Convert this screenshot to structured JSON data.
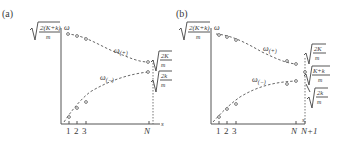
{
  "panels": [
    {
      "label": "(a)",
      "y_axis_label": "ω",
      "x_axis_label": "s",
      "top_value": {
        "num": "2(K+k)",
        "den": "m"
      },
      "upper_branch": {
        "name": "ω",
        "sub": "(+)"
      },
      "lower_branch": {
        "name": "ω",
        "sub": "(−)"
      },
      "upper_end_value": {
        "num": "2K",
        "den": "m"
      },
      "lower_end_value": {
        "num": "2k",
        "den": "m"
      },
      "x_ticks": [
        "1",
        "2",
        "3",
        "N"
      ]
    },
    {
      "label": "(b)",
      "y_axis_label": "ω",
      "x_axis_label": "s",
      "top_value": {
        "num": "2(K+k)",
        "den": "m"
      },
      "upper_branch": {
        "name": "ω",
        "sub": "(+)"
      },
      "lower_branch": {
        "name": "ω",
        "sub": "(−)"
      },
      "upper_end_value": {
        "num": "2K",
        "den": "m"
      },
      "middle_value": {
        "num": "K+k",
        "den": "m"
      },
      "lower_end_value": {
        "num": "2k",
        "den": "m"
      },
      "x_ticks": [
        "1",
        "2",
        "3",
        "N",
        "N+1"
      ]
    }
  ]
}
